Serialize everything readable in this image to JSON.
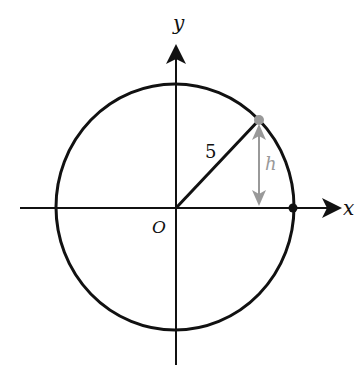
{
  "diagram": {
    "labels": {
      "y_axis": "y",
      "x_axis": "x",
      "origin": "O",
      "radius": "5",
      "height": "h"
    },
    "colors": {
      "line": "#111111",
      "highlight": "#999999",
      "background": "#ffffff"
    },
    "geometry": {
      "radius_value": 5,
      "origin": [
        0,
        0
      ],
      "point_on_circle": "gray point on circle in first quadrant",
      "x_intercept_point": "black point at (5, 0)"
    }
  }
}
